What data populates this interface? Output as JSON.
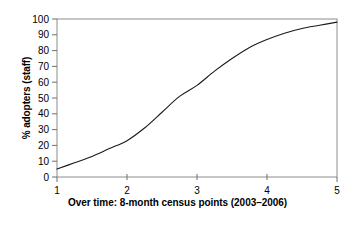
{
  "chart_data": {
    "type": "line",
    "title": "",
    "xlabel": "Over time: 8-month census points (2003–2006)",
    "ylabel": "% adopters (staff)",
    "x": [
      1,
      2,
      3,
      4,
      5
    ],
    "values": [
      5,
      23,
      58,
      87,
      98
    ],
    "series": [
      {
        "name": "% adopters (staff)",
        "values": [
          5,
          23,
          58,
          87,
          98
        ]
      }
    ],
    "xlim": [
      1,
      5
    ],
    "ylim": [
      0,
      100
    ],
    "xticks": [
      "1",
      "2",
      "3",
      "4",
      "5"
    ],
    "yticks": [
      "0",
      "10",
      "20",
      "30",
      "40",
      "50",
      "60",
      "70",
      "80",
      "90",
      "100"
    ],
    "grid": false,
    "legend": false,
    "line_color": "#1a1a1a",
    "axis_color": "#808080",
    "background": "#ffffff",
    "curve_points": [
      {
        "x": 1.0,
        "y": 5
      },
      {
        "x": 1.25,
        "y": 9
      },
      {
        "x": 1.5,
        "y": 13
      },
      {
        "x": 1.75,
        "y": 18
      },
      {
        "x": 2.0,
        "y": 23
      },
      {
        "x": 2.25,
        "y": 31
      },
      {
        "x": 2.5,
        "y": 41
      },
      {
        "x": 2.75,
        "y": 51
      },
      {
        "x": 3.0,
        "y": 58
      },
      {
        "x": 3.25,
        "y": 67
      },
      {
        "x": 3.5,
        "y": 75
      },
      {
        "x": 3.75,
        "y": 82
      },
      {
        "x": 4.0,
        "y": 87
      },
      {
        "x": 4.25,
        "y": 91
      },
      {
        "x": 4.5,
        "y": 94
      },
      {
        "x": 4.75,
        "y": 96
      },
      {
        "x": 5.0,
        "y": 98
      }
    ]
  },
  "axis": {
    "y_labels": [
      "100",
      "90",
      "80",
      "70",
      "60",
      "50",
      "40",
      "30",
      "20",
      "10",
      "0"
    ],
    "x_labels": [
      "1",
      "2",
      "3",
      "4",
      "5"
    ],
    "y_title": "% adopters (staff)",
    "x_title": "Over time: 8-month census points (2003–2006)"
  }
}
